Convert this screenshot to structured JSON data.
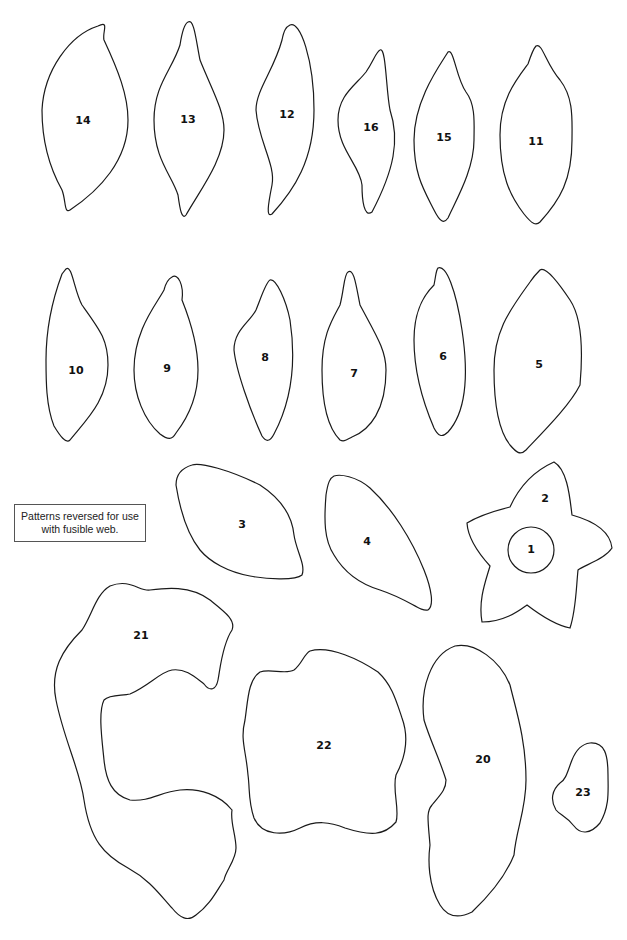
{
  "page": {
    "background": "#ffffff",
    "stroke_color": "#1a1a1a"
  },
  "note": {
    "line1": "Patterns reversed for use",
    "line2": "with fusible web."
  },
  "pieces": {
    "p1": "1",
    "p2": "2",
    "p3": "3",
    "p4": "4",
    "p5": "5",
    "p6": "6",
    "p7": "7",
    "p8": "8",
    "p9": "9",
    "p10": "10",
    "p11": "11",
    "p12": "12",
    "p13": "13",
    "p14": "14",
    "p15": "15",
    "p16": "16",
    "p20": "20",
    "p21": "21",
    "p22": "22",
    "p23": "23"
  }
}
